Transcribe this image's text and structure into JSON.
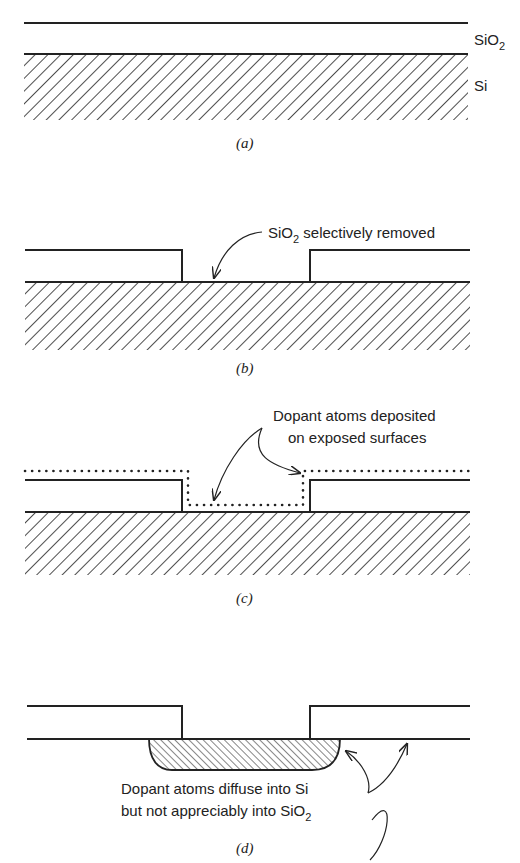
{
  "figure": {
    "panels": [
      {
        "id": "a",
        "caption": "(a)",
        "labels": {
          "oxide": "SiO",
          "oxide_sub": "2",
          "substrate": "Si"
        }
      },
      {
        "id": "b",
        "caption": "(b)",
        "annotation": {
          "pre": "SiO",
          "sub": "2",
          "post": " selectively removed"
        }
      },
      {
        "id": "c",
        "caption": "(c)",
        "annotation": {
          "line1": "Dopant atoms deposited",
          "line2": "on exposed surfaces"
        }
      },
      {
        "id": "d",
        "caption": "(d)",
        "annotation": {
          "line1": "Dopant atoms diffuse into Si",
          "line2_pre": "but not appreciably into SiO",
          "line2_sub": "2"
        }
      }
    ]
  }
}
